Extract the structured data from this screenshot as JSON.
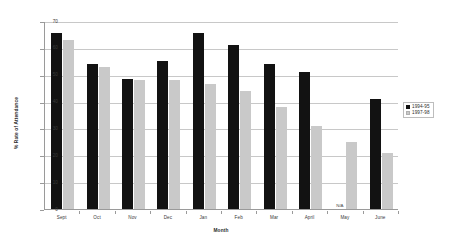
{
  "chart_data": {
    "type": "bar",
    "title": "",
    "xlabel": "Month",
    "ylabel": "% Rate of Attendance",
    "ylim": [
      0,
      70
    ],
    "ytick_step": 10,
    "yticks": [
      0,
      10,
      20,
      30,
      40,
      50,
      60,
      70
    ],
    "grid": true,
    "legend_position": "right",
    "categories": [
      "Sept",
      "Oct",
      "Nov",
      "Dec",
      "Jan",
      "Feb",
      "Mar",
      "April",
      "May",
      "June"
    ],
    "series": [
      {
        "name": "1994-95",
        "color": "#121212",
        "values": [
          65.5,
          54,
          48.5,
          55,
          65.5,
          61,
          54,
          51,
          null,
          41
        ],
        "missing_label": "N/A"
      },
      {
        "name": "1997-98",
        "color": "#c9c9c9",
        "values": [
          63,
          53,
          48,
          48,
          46.5,
          44,
          38,
          31,
          25,
          21
        ]
      }
    ],
    "annotations": [
      {
        "category": "May",
        "series": "1994-95",
        "text": "N/A"
      }
    ]
  },
  "legend": {
    "items": [
      {
        "label": "1994-95",
        "swatch": "dark"
      },
      {
        "label": "1997-98",
        "swatch": "light"
      }
    ]
  },
  "axes": {
    "y_title": "% Rate of Attendance",
    "x_title": "Month"
  }
}
